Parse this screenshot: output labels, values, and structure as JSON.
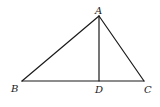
{
  "diagram": {
    "type": "geometry-triangle",
    "points": {
      "A": {
        "label": "A",
        "x": 99,
        "y": 16
      },
      "B": {
        "label": "B",
        "x": 22,
        "y": 81
      },
      "C": {
        "label": "C",
        "x": 144,
        "y": 81
      },
      "D": {
        "label": "D",
        "x": 99,
        "y": 81
      }
    },
    "segments": [
      {
        "from": "A",
        "to": "B"
      },
      {
        "from": "A",
        "to": "C"
      },
      {
        "from": "B",
        "to": "C"
      },
      {
        "from": "A",
        "to": "D"
      }
    ],
    "labels": {
      "A": "A",
      "B": "B",
      "C": "C",
      "D": "D"
    },
    "colors": {
      "line": "#1a1a1a",
      "background": "#ffffff"
    }
  }
}
